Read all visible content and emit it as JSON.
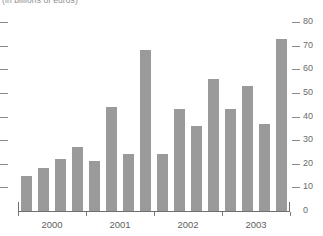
{
  "chart_data": {
    "type": "bar",
    "title": "",
    "subtitle": "(in billions of euros)",
    "xlabel": "",
    "ylabel": "",
    "ylim": [
      0,
      80
    ],
    "yticks": [
      0,
      10,
      20,
      30,
      40,
      50,
      60,
      70,
      80
    ],
    "ytick_labels": [
      "0",
      "10",
      "20",
      "30",
      "40",
      "50",
      "60",
      "70",
      "80"
    ],
    "y_axis_position": "right",
    "grid": false,
    "legend": null,
    "bar_color": "#9a9a9a",
    "categories": [
      "2000 Q1",
      "2000 Q2",
      "2000 Q3",
      "2000 Q4",
      "2001 Q1",
      "2001 Q2",
      "2001 Q3",
      "2001 Q4",
      "2002 Q1",
      "2002 Q2",
      "2002 Q3",
      "2002 Q4",
      "2003 Q1",
      "2003 Q2",
      "2003 Q3",
      "2003 Q4"
    ],
    "values": [
      15,
      18,
      22,
      27,
      21,
      44,
      24,
      68,
      24,
      43,
      36,
      56,
      43,
      53,
      37,
      73
    ],
    "x_axis_tick_labels": [
      "2000",
      "2001",
      "2002",
      "2003"
    ],
    "x_axis_group_size": 4
  },
  "caption": {
    "units": "(in billions of euros)"
  }
}
